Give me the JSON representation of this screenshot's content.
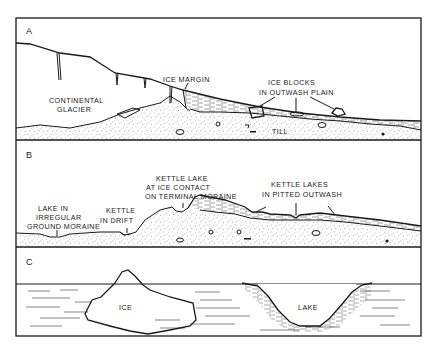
{
  "panels": [
    {
      "letter": "A",
      "labels": {
        "glacier_line1": "CONTINENTAL",
        "glacier_line2": "GLACIER",
        "ice_margin": "ICE MARGIN",
        "ice_blocks_line1": "ICE BLOCKS",
        "ice_blocks_line2": "IN OUTWASH PLAIN",
        "till": "TILL"
      }
    },
    {
      "letter": "B",
      "labels": {
        "lake_moraine_line1": "LAKE IN",
        "lake_moraine_line2": "IRREGULAR",
        "lake_moraine_line3": "GROUND MORAINE",
        "kettle_drift_line1": "KETTLE",
        "kettle_drift_line2": "IN DRIFT",
        "kettle_lake_line1": "KETTLE LAKE",
        "kettle_lake_line2": "AT ICE CONTACT",
        "kettle_lake_line3": "ON TERMINAL MORAINE",
        "kettle_lakes_line1": "KETTLE LAKES",
        "kettle_lakes_line2": "IN PITTED OUTWASH"
      }
    },
    {
      "letter": "C",
      "labels": {
        "ice": "ICE",
        "lake": "LAKE"
      }
    }
  ],
  "colors": {
    "ink": "#1a1a1a",
    "background": "#ffffff",
    "stipple": "#555555"
  }
}
